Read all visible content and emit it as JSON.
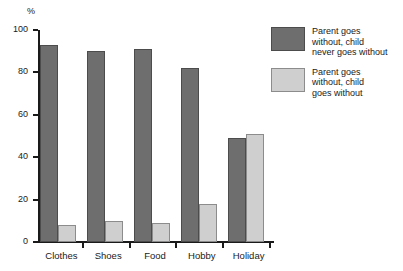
{
  "chart_data": {
    "type": "bar",
    "title": "",
    "subtitle": "",
    "xlabel": "",
    "ylabel": "%",
    "ylim": [
      0,
      100
    ],
    "yticks": [
      0,
      20,
      40,
      60,
      80,
      100
    ],
    "ytick_labels": [
      "0",
      "20",
      "40",
      "60",
      "80",
      "100"
    ],
    "grid": false,
    "legend_position": "right",
    "categories": [
      "Clothes",
      "Shoes",
      "Food",
      "Hobby",
      "Holiday"
    ],
    "series": [
      {
        "name": "Parent goes without, child never goes without",
        "color": "#6e6e6e",
        "values": [
          93,
          90,
          91,
          82,
          49
        ]
      },
      {
        "name": "Parent goes without, child goes without",
        "color": "#cfcfcf",
        "values": [
          8,
          10,
          9,
          18,
          51
        ]
      }
    ],
    "legend": [
      {
        "line1": "Parent goes",
        "line2": "without, child",
        "line3": "never goes without",
        "color": "#6e6e6e"
      },
      {
        "line1": "Parent goes",
        "line2": "without, child",
        "line3": "goes without",
        "color": "#cfcfcf"
      }
    ]
  }
}
